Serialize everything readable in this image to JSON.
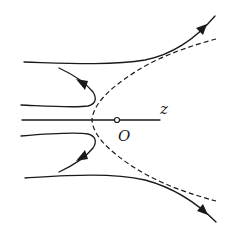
{
  "diagram": {
    "labels": {
      "axis": "z",
      "origin": "O"
    },
    "elements": {
      "dashed_boundary": "hyperbola (dashed), vertex left of O",
      "axis_line": "horizontal z axis through O",
      "curves": [
        {
          "name": "upper-outer-curve",
          "direction": "right-up",
          "arrow": "outward"
        },
        {
          "name": "upper-inner-curve",
          "direction": "up-left",
          "arrow": "outward"
        },
        {
          "name": "lower-inner-curve",
          "direction": "down-left",
          "arrow": "outward"
        },
        {
          "name": "lower-outer-curve",
          "direction": "right-down",
          "arrow": "outward"
        }
      ]
    },
    "colors": {
      "stroke": "#1a1a1a",
      "background": "#ffffff"
    }
  }
}
